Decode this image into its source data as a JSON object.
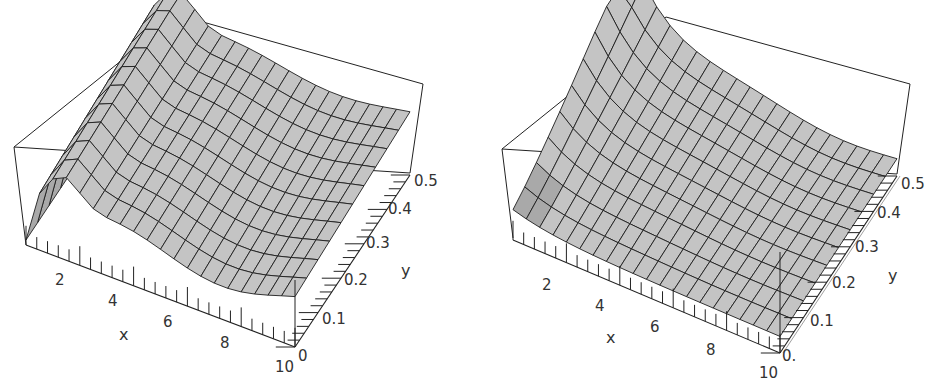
{
  "chart_data": [
    {
      "type": "surface3d",
      "title": "",
      "xlabel": "x",
      "ylabel": "y",
      "zlabel": "",
      "x_ticks": [
        "2",
        "4",
        "6",
        "8",
        "10"
      ],
      "y_ticks": [
        "0",
        "0.1",
        "0.2",
        "0.3",
        "0.4",
        "0.5"
      ],
      "xlim": [
        0,
        10
      ],
      "ylim": [
        0,
        0.5
      ],
      "z_ticks_shown": false,
      "box": true,
      "mesh": true,
      "description": "Surface with a narrow drop at x near 0, a ridge near x approximately 1 to 2, and a gentle wave (one crest and one trough) along x that varies smoothly with y"
    },
    {
      "type": "surface3d",
      "title": "",
      "xlabel": "x",
      "ylabel": "y",
      "zlabel": "",
      "x_ticks": [
        "2",
        "4",
        "6",
        "8",
        "10"
      ],
      "y_ticks": [
        "0.",
        "0.1",
        "0.2",
        "0.3",
        "0.4",
        "0.5"
      ],
      "xlim": [
        0,
        10
      ],
      "ylim": [
        0,
        0.5
      ],
      "z_ticks_shown": false,
      "box": true,
      "mesh": true,
      "description": "Surface that is high at large y and small x, decaying steeply with x toward a low, gently wavy plateau"
    }
  ],
  "plots": {
    "left": {
      "x_label": "x",
      "y_label": "y",
      "x_ticks": [
        "2",
        "4",
        "6",
        "8",
        "10"
      ],
      "y_ticks": [
        "0",
        "0.1",
        "0.2",
        "0.3",
        "0.4",
        "0.5"
      ]
    },
    "right": {
      "x_label": "x",
      "y_label": "y",
      "x_ticks": [
        "2",
        "4",
        "6",
        "8",
        "10"
      ],
      "y_ticks": [
        "0.",
        "0.1",
        "0.2",
        "0.3",
        "0.4",
        "0.5"
      ]
    }
  },
  "colors": {
    "surface": "#c4c4c4",
    "surface_dark": "#a9a9a9",
    "mesh": "#1e1e1e",
    "box": "#222222",
    "background": "#ffffff"
  }
}
